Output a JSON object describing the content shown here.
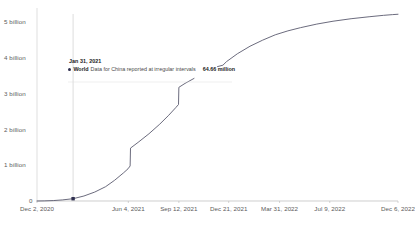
{
  "chart_data": {
    "type": "line",
    "title": "",
    "subtitle": "",
    "xlabel": "",
    "ylabel": "",
    "ylim": [
      0,
      5400000000
    ],
    "xlim": [
      "Dec 2, 2020",
      "Dec 6, 2022"
    ],
    "grid": false,
    "legend_position": "none",
    "y_ticks": [
      {
        "value": 0,
        "label": "0"
      },
      {
        "value": 1000000000,
        "label": "1 billion"
      },
      {
        "value": 2000000000,
        "label": "2 billion"
      },
      {
        "value": 3000000000,
        "label": "3 billion"
      },
      {
        "value": 4000000000,
        "label": "4 billion"
      },
      {
        "value": 5000000000,
        "label": "5 billion"
      }
    ],
    "x_ticks": [
      {
        "label": "Dec 2, 2020",
        "position": 0.0
      },
      {
        "label": "Jun 4, 2021",
        "position": 0.253
      },
      {
        "label": "Sep 12, 2021",
        "position": 0.393
      },
      {
        "label": "Dec 21, 2021",
        "position": 0.531
      },
      {
        "label": "Mar 31, 2022",
        "position": 0.672
      },
      {
        "label": "Jul 9, 2022",
        "position": 0.811
      },
      {
        "label": "Dec 6, 2022",
        "position": 1.0
      }
    ],
    "series": [
      {
        "name": "World",
        "color": "#5a5a6e",
        "points": [
          {
            "x": 0.0,
            "y": 0
          },
          {
            "x": 0.02,
            "y": 3000000
          },
          {
            "x": 0.045,
            "y": 12000000
          },
          {
            "x": 0.07,
            "y": 30000000
          },
          {
            "x": 0.1,
            "y": 64660000
          },
          {
            "x": 0.13,
            "y": 140000000
          },
          {
            "x": 0.16,
            "y": 250000000
          },
          {
            "x": 0.19,
            "y": 400000000
          },
          {
            "x": 0.215,
            "y": 580000000
          },
          {
            "x": 0.24,
            "y": 790000000
          },
          {
            "x": 0.252,
            "y": 900000000
          },
          {
            "x": 0.258,
            "y": 980000000
          },
          {
            "x": 0.259,
            "y": 1480000000
          },
          {
            "x": 0.28,
            "y": 1640000000
          },
          {
            "x": 0.31,
            "y": 1880000000
          },
          {
            "x": 0.34,
            "y": 2150000000
          },
          {
            "x": 0.365,
            "y": 2400000000
          },
          {
            "x": 0.385,
            "y": 2620000000
          },
          {
            "x": 0.392,
            "y": 2700000000
          },
          {
            "x": 0.393,
            "y": 3180000000
          },
          {
            "x": 0.41,
            "y": 3290000000
          },
          {
            "x": 0.435,
            "y": 3430000000
          }
        ]
      },
      {
        "name": "World",
        "color": "#5a5a6e",
        "points": [
          {
            "x": 0.5,
            "y": 3760000000
          },
          {
            "x": 0.515,
            "y": 3800000000
          },
          {
            "x": 0.525,
            "y": 3900000000
          },
          {
            "x": 0.555,
            "y": 4120000000
          },
          {
            "x": 0.59,
            "y": 4330000000
          },
          {
            "x": 0.625,
            "y": 4500000000
          },
          {
            "x": 0.66,
            "y": 4650000000
          },
          {
            "x": 0.695,
            "y": 4760000000
          },
          {
            "x": 0.73,
            "y": 4850000000
          },
          {
            "x": 0.775,
            "y": 4950000000
          },
          {
            "x": 0.82,
            "y": 5030000000
          },
          {
            "x": 0.87,
            "y": 5100000000
          },
          {
            "x": 0.92,
            "y": 5155000000
          },
          {
            "x": 0.96,
            "y": 5195000000
          },
          {
            "x": 0.985,
            "y": 5215000000
          },
          {
            "x": 1.0,
            "y": 5225000000
          }
        ]
      }
    ],
    "annotations": [
      {
        "type": "crosshair",
        "x_position": 0.1,
        "label": "vertical-hover-line"
      },
      {
        "type": "marker",
        "x_position": 0.1,
        "y_value": 64660000,
        "shape": "square",
        "color": "#2f2f4f"
      }
    ]
  },
  "tooltip": {
    "date": "Jan 31, 2021",
    "series_name": "World",
    "note": "Data for China reported at irregular intervals",
    "value": "64.66 million"
  },
  "axis_colors": {
    "axis_line": "#b9b9b9",
    "tick_text": "#5b5b5b",
    "line": "#5a5a6e",
    "crosshair": "#c9c9c9"
  }
}
